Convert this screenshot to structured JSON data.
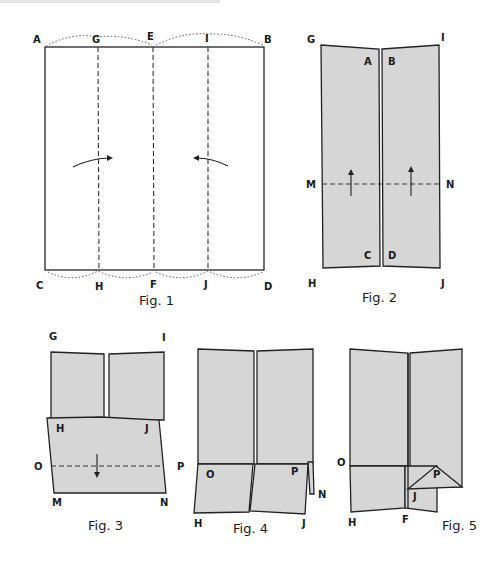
{
  "figures": [
    {
      "id": "fig1",
      "caption": "Fig. 1",
      "labels": {
        "A": "A",
        "G": "G",
        "E": "E",
        "I": "I",
        "B": "B",
        "C": "C",
        "H": "H",
        "F": "F",
        "J": "J",
        "D": "D"
      }
    },
    {
      "id": "fig2",
      "caption": "Fig. 2",
      "labels": {
        "G": "G",
        "I": "I",
        "A": "A",
        "B": "B",
        "M": "M",
        "N": "N",
        "C": "C",
        "D": "D",
        "H": "H",
        "J": "J"
      }
    },
    {
      "id": "fig3",
      "caption": "Fig. 3",
      "labels": {
        "G": "G",
        "I": "I",
        "H": "H",
        "J": "J",
        "O": "O",
        "P": "P",
        "M": "M",
        "N": "N"
      }
    },
    {
      "id": "fig4",
      "caption": "Fig. 4",
      "labels": {
        "O": "O",
        "P": "P",
        "N": "N",
        "H": "H",
        "J": "J"
      }
    },
    {
      "id": "fig5",
      "caption": "Fig. 5",
      "labels": {
        "O": "O",
        "P": "P",
        "J": "J",
        "H": "H",
        "F": "F"
      }
    }
  ],
  "colors": {
    "paper_fill": "#d6d6d6",
    "line": "#222222",
    "background": "#ffffff"
  }
}
